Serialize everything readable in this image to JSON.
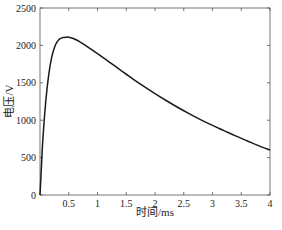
{
  "chart_data": {
    "type": "line",
    "title": "",
    "xlabel": "时间/ms",
    "ylabel": "电压/V",
    "xlim": [
      0,
      4
    ],
    "ylim": [
      0,
      2500
    ],
    "xticks": [
      0.5,
      1,
      1.5,
      2,
      2.5,
      3,
      3.5,
      4
    ],
    "xtick_labels": [
      "0.5",
      "1",
      "1.5",
      "2",
      "2.5",
      "3",
      "3.5",
      "4"
    ],
    "yticks": [
      0,
      500,
      1000,
      1500,
      2000,
      2500
    ],
    "ytick_labels": [
      "0",
      "500",
      "1000",
      "1500",
      "2000",
      "2500"
    ],
    "grid": false,
    "legend": null,
    "series": [
      {
        "name": "电压",
        "color": "#1a1a1a",
        "x": [
          0,
          0.02,
          0.05,
          0.1,
          0.15,
          0.2,
          0.25,
          0.3,
          0.35,
          0.4,
          0.45,
          0.5,
          0.55,
          0.6,
          0.7,
          0.8,
          0.9,
          1.0,
          1.2,
          1.4,
          1.6,
          1.8,
          2.0,
          2.2,
          2.4,
          2.6,
          2.8,
          3.0,
          3.2,
          3.4,
          3.6,
          3.8,
          4.0
        ],
        "y": [
          0,
          300,
          750,
          1250,
          1600,
          1830,
          1970,
          2050,
          2090,
          2105,
          2110,
          2110,
          2100,
          2085,
          2045,
          1995,
          1945,
          1890,
          1780,
          1670,
          1560,
          1455,
          1355,
          1260,
          1170,
          1085,
          1005,
          930,
          860,
          790,
          725,
          660,
          600
        ]
      }
    ]
  }
}
